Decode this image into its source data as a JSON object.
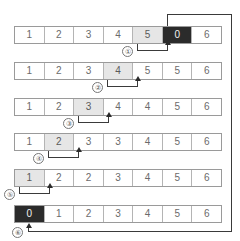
{
  "figure": {
    "cell_count": 7,
    "row_count": 6,
    "colors": {
      "highlight": "#e6e6e6",
      "dark_cell": "#2b2b2b",
      "border": "#9a9a9a",
      "text": "#6b6b6b",
      "line": "#3a3a3a"
    },
    "rows": [
      {
        "id": "row-1",
        "cells": [
          {
            "value": "1",
            "style": "normal"
          },
          {
            "value": "2",
            "style": "normal"
          },
          {
            "value": "3",
            "style": "normal"
          },
          {
            "value": "4",
            "style": "normal"
          },
          {
            "value": "5",
            "style": "highlight"
          },
          {
            "value": "0",
            "style": "dark"
          },
          {
            "value": "6",
            "style": "normal"
          }
        ],
        "step": "①",
        "step_from_index": 4,
        "step_to_index": 5
      },
      {
        "id": "row-2",
        "cells": [
          {
            "value": "1",
            "style": "normal"
          },
          {
            "value": "2",
            "style": "normal"
          },
          {
            "value": "3",
            "style": "normal"
          },
          {
            "value": "4",
            "style": "highlight"
          },
          {
            "value": "5",
            "style": "normal"
          },
          {
            "value": "5",
            "style": "normal"
          },
          {
            "value": "6",
            "style": "normal"
          }
        ],
        "step": "②",
        "step_from_index": 3,
        "step_to_index": 4
      },
      {
        "id": "row-3",
        "cells": [
          {
            "value": "1",
            "style": "normal"
          },
          {
            "value": "2",
            "style": "normal"
          },
          {
            "value": "3",
            "style": "highlight"
          },
          {
            "value": "4",
            "style": "normal"
          },
          {
            "value": "4",
            "style": "normal"
          },
          {
            "value": "5",
            "style": "normal"
          },
          {
            "value": "6",
            "style": "normal"
          }
        ],
        "step": "③",
        "step_from_index": 2,
        "step_to_index": 3
      },
      {
        "id": "row-4",
        "cells": [
          {
            "value": "1",
            "style": "normal"
          },
          {
            "value": "2",
            "style": "highlight"
          },
          {
            "value": "3",
            "style": "normal"
          },
          {
            "value": "3",
            "style": "normal"
          },
          {
            "value": "4",
            "style": "normal"
          },
          {
            "value": "5",
            "style": "normal"
          },
          {
            "value": "6",
            "style": "normal"
          }
        ],
        "step": "④",
        "step_from_index": 1,
        "step_to_index": 2
      },
      {
        "id": "row-5",
        "cells": [
          {
            "value": "1",
            "style": "highlight"
          },
          {
            "value": "2",
            "style": "normal"
          },
          {
            "value": "2",
            "style": "normal"
          },
          {
            "value": "3",
            "style": "normal"
          },
          {
            "value": "4",
            "style": "normal"
          },
          {
            "value": "5",
            "style": "normal"
          },
          {
            "value": "6",
            "style": "normal"
          }
        ],
        "step": "⑤",
        "step_from_index": 0,
        "step_to_index": 1
      },
      {
        "id": "row-6",
        "cells": [
          {
            "value": "0",
            "style": "dark"
          },
          {
            "value": "1",
            "style": "normal"
          },
          {
            "value": "2",
            "style": "normal"
          },
          {
            "value": "3",
            "style": "normal"
          },
          {
            "value": "4",
            "style": "normal"
          },
          {
            "value": "5",
            "style": "normal"
          },
          {
            "value": "6",
            "style": "normal"
          }
        ],
        "step": "⑥",
        "step_from_index": 6,
        "step_to_index": 0
      }
    ]
  }
}
